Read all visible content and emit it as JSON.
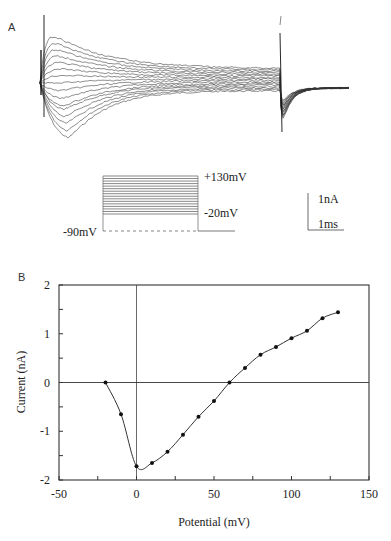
{
  "panel_a": {
    "label": "A",
    "stimulus": {
      "top_label": "+130mV",
      "step_label": "-20mV",
      "holding_label": "-90mV",
      "step_count": 16
    },
    "scale_bar": {
      "current_label": "1nA",
      "time_label": "1ms"
    }
  },
  "panel_b": {
    "label": "B"
  },
  "chart_data": [
    {
      "type": "line",
      "title": "Whole-cell current traces evoked by voltage steps from -90mV (-20mV to +130mV)",
      "panel": "A",
      "xlabel": "",
      "ylabel": "",
      "scale_bar": {
        "y": "1nA",
        "x": "1ms"
      },
      "annotations": [
        "+130mV",
        "-20mV",
        "-90mV"
      ],
      "grid": false
    },
    {
      "type": "scatter",
      "panel": "B",
      "title": "",
      "xlabel": "Potential (mV)",
      "ylabel": "Current (nA)",
      "xlim": [
        -50,
        150
      ],
      "ylim": [
        -2,
        2
      ],
      "xticks": [
        -50,
        0,
        50,
        100,
        150
      ],
      "yticks": [
        -2,
        -1,
        0,
        1,
        2
      ],
      "xtick_labels": [
        "-50",
        "0",
        "50",
        "100",
        "150"
      ],
      "ytick_labels": [
        "-2",
        "-1",
        "0",
        "1",
        "2"
      ],
      "grid": false,
      "reference_lines": {
        "x": 0,
        "y": 0
      },
      "series": [
        {
          "name": "I-V",
          "x": [
            -20,
            -10,
            0,
            10,
            20,
            30,
            40,
            50,
            60,
            70,
            80,
            90,
            100,
            110,
            120,
            130
          ],
          "y": [
            0.0,
            -0.65,
            -1.72,
            -1.65,
            -1.42,
            -1.07,
            -0.7,
            -0.38,
            0.0,
            0.3,
            0.57,
            0.73,
            0.91,
            1.06,
            1.32,
            1.44
          ]
        }
      ]
    }
  ]
}
